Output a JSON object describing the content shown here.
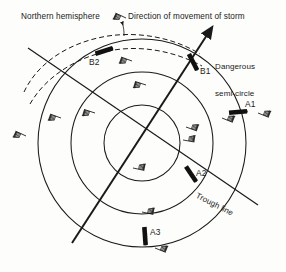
{
  "figure": {
    "background_color": "#fdfdfb",
    "ink_color": "#1a1a1a"
  },
  "labels": {
    "northern_hemisphere": "Northern hemisphere",
    "direction_of_movement": "Direction of movement of storm",
    "dangerous_semicircle_line1": "Dangerous",
    "dangerous_semicircle_line2": "semi-circle",
    "trough_line": "Trough line"
  },
  "ship_markers": [
    {
      "id": "B2",
      "label": "B2",
      "x": 104,
      "y": 51,
      "angle": -18
    },
    {
      "id": "B1",
      "label": "B1",
      "x": 193,
      "y": 62,
      "angle": 63
    },
    {
      "id": "A1",
      "label": "A1",
      "x": 238,
      "y": 112,
      "angle": -5
    },
    {
      "id": "A2",
      "label": "A2",
      "x": 191,
      "y": 174,
      "angle": 56
    },
    {
      "id": "A3",
      "label": "A3",
      "x": 145,
      "y": 236,
      "angle": 86
    }
  ],
  "circles": [
    {
      "name": "outer-circle",
      "cx": 142,
      "cy": 143,
      "r": 104
    },
    {
      "name": "middle-circle",
      "cx": 142,
      "cy": 143,
      "r": 71
    },
    {
      "name": "inner-circle",
      "cx": 142,
      "cy": 143,
      "r": 38
    }
  ],
  "storm_track": {
    "name": "direction-of-movement-arrow",
    "x1": 72,
    "y1": 243,
    "x2": 207,
    "y2": 35
  },
  "trough_line": {
    "name": "trough-line",
    "x1": 28,
    "y1": 48,
    "x2": 258,
    "y2": 205
  },
  "past_track": {
    "name": "past-track-dashed-arc",
    "dash": "5 3"
  },
  "wind_barbs": [
    {
      "x": 126,
      "y": 18,
      "angle": 205
    },
    {
      "x": 132,
      "y": 61,
      "angle": 200
    },
    {
      "x": 146,
      "y": 85,
      "angle": 198
    },
    {
      "x": 95,
      "y": 113,
      "angle": 198
    },
    {
      "x": 61,
      "y": 118,
      "angle": 200
    },
    {
      "x": 26,
      "y": 136,
      "angle": 205
    },
    {
      "x": 186,
      "y": 127,
      "angle": 20
    },
    {
      "x": 222,
      "y": 118,
      "angle": 22
    },
    {
      "x": 258,
      "y": 113,
      "angle": 22
    },
    {
      "x": 133,
      "y": 168,
      "angle": 12
    },
    {
      "x": 183,
      "y": 140,
      "angle": 10
    },
    {
      "x": 142,
      "y": 212,
      "angle": 12
    },
    {
      "x": 155,
      "y": 248,
      "angle": 22
    }
  ]
}
